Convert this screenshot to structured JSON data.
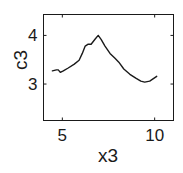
{
  "chart_data": {
    "type": "line",
    "title": "",
    "xlabel": "x3",
    "ylabel": "c3",
    "xlim": [
      3.98,
      11.02
    ],
    "ylim": [
      2.25,
      4.43
    ],
    "xticks": [
      5,
      10
    ],
    "yticks": [
      3,
      4
    ],
    "xtick_labels": [
      "5",
      "10"
    ],
    "ytick_labels": [
      "3",
      "4"
    ],
    "grid": false,
    "legend": null,
    "series": [
      {
        "name": "c3",
        "color": "#1a1a1a",
        "x": [
          4.46,
          4.68,
          4.78,
          4.89,
          5.05,
          5.32,
          5.65,
          5.91,
          6.08,
          6.24,
          6.4,
          6.56,
          6.77,
          6.94,
          7.1,
          7.31,
          7.58,
          7.85,
          8.06,
          8.33,
          8.66,
          8.98,
          9.25,
          9.46,
          9.73,
          10.11
        ],
        "y": [
          3.27,
          3.29,
          3.29,
          3.24,
          3.27,
          3.33,
          3.41,
          3.49,
          3.63,
          3.78,
          3.82,
          3.82,
          3.92,
          4.0,
          3.92,
          3.78,
          3.63,
          3.53,
          3.45,
          3.31,
          3.2,
          3.12,
          3.06,
          3.04,
          3.06,
          3.16
        ]
      }
    ]
  }
}
